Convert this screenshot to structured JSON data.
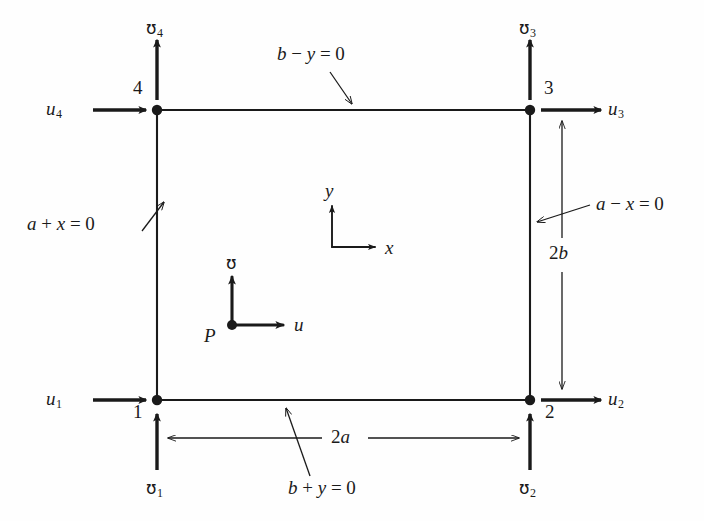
{
  "figure": {
    "ink_color": "#1a1a1a",
    "background_color": "#fefefe"
  },
  "element": {
    "shape": "rectangle",
    "width_label": "2a",
    "height_label": "2b"
  },
  "nodes": [
    {
      "id": "1",
      "number": "1",
      "corner": "bottom-left"
    },
    {
      "id": "2",
      "number": "2",
      "corner": "bottom-right"
    },
    {
      "id": "3",
      "number": "3",
      "corner": "top-right"
    },
    {
      "id": "4",
      "number": "4",
      "corner": "top-left"
    }
  ],
  "dofs": {
    "u1": {
      "base": "u",
      "sub": "1",
      "direction": "right"
    },
    "u2": {
      "base": "u",
      "sub": "2",
      "direction": "right"
    },
    "u3": {
      "base": "u",
      "sub": "3",
      "direction": "right"
    },
    "u4": {
      "base": "u",
      "sub": "4",
      "direction": "right"
    },
    "v1": {
      "base": "ʊ",
      "sub": "1",
      "direction": "up"
    },
    "v2": {
      "base": "ʊ",
      "sub": "2",
      "direction": "up"
    },
    "v3": {
      "base": "ʊ",
      "sub": "3",
      "direction": "up"
    },
    "v4": {
      "base": "ʊ",
      "sub": "4",
      "direction": "up"
    }
  },
  "edge_equations": {
    "top": {
      "lhs": "b",
      "op": "−",
      "var": "y",
      "eq": "= 0",
      "full": "b − y = 0"
    },
    "bottom": {
      "lhs": "b",
      "op": "+",
      "var": "y",
      "eq": "= 0",
      "full": "b + y = 0"
    },
    "left": {
      "lhs": "a",
      "op": "+",
      "var": "x",
      "eq": "= 0",
      "full": "a + x = 0"
    },
    "right": {
      "lhs": "a",
      "op": "−",
      "var": "x",
      "eq": "= 0",
      "full": "a − x = 0"
    }
  },
  "global_axes": {
    "origin_label": "",
    "x_label": "x",
    "y_label": "y"
  },
  "local_point": {
    "point_label": "P",
    "u_label": "u",
    "v_label": "ʊ"
  },
  "dimensions": {
    "horizontal": {
      "label": "2a",
      "num": "2",
      "sym": "a"
    },
    "vertical": {
      "label": "2b",
      "num": "2",
      "sym": "b"
    }
  }
}
